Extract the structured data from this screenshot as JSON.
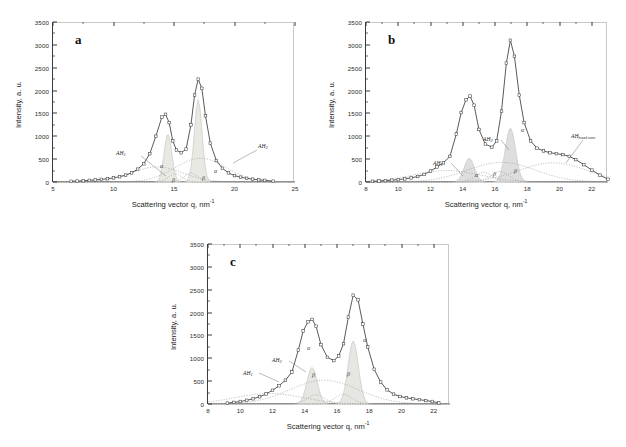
{
  "figure": {
    "axis_label_x": "Scattering vector q, nm",
    "axis_label_x_sup": "-1",
    "axis_label_y": "Intensity, a. u."
  },
  "chart_data": [
    {
      "type": "line",
      "panel": "a",
      "title": "a",
      "xlabel": "Scattering vector q, nm-1",
      "ylabel": "Intensity, a. u.",
      "xlim": [
        5,
        25
      ],
      "ylim": [
        0,
        3500
      ],
      "xticks": [
        5,
        10,
        15,
        20,
        25
      ],
      "yticks": [
        0,
        500,
        1000,
        1500,
        2000,
        2500,
        3000,
        3500
      ],
      "grid": false,
      "legend": "none",
      "series": [
        {
          "name": "experimental",
          "marker": "open-square",
          "x": [
            6.5,
            7.0,
            7.5,
            8.0,
            8.5,
            9.0,
            9.5,
            10.0,
            10.5,
            11.0,
            11.5,
            12.0,
            12.5,
            13.0,
            13.5,
            14.0,
            14.3,
            14.6,
            14.9,
            15.2,
            15.6,
            16.0,
            16.4,
            16.7,
            17.0,
            17.3,
            17.6,
            18.0,
            18.5,
            19.0,
            19.5,
            20.0,
            20.5,
            21.0,
            21.5,
            22.0,
            22.5,
            23.2
          ],
          "y": [
            15,
            20,
            28,
            35,
            45,
            58,
            72,
            90,
            115,
            150,
            200,
            280,
            400,
            620,
            1000,
            1420,
            1480,
            1300,
            900,
            700,
            640,
            720,
            1250,
            1900,
            2250,
            2050,
            1450,
            850,
            470,
            300,
            200,
            140,
            105,
            80,
            62,
            48,
            36,
            18
          ]
        },
        {
          "name": "alpha-peak-1",
          "label": "a",
          "center": 14.5,
          "height": 1050,
          "fill": "#e9e9e4"
        },
        {
          "name": "alpha-peak-2",
          "label": "a",
          "center": 17.0,
          "height": 1800,
          "fill": "#e9e9e4"
        },
        {
          "name": "beta-peak-1",
          "label": "b",
          "center": 15.1,
          "height": 180
        },
        {
          "name": "beta-peak-2",
          "label": "b",
          "center": 16.4,
          "height": 200
        },
        {
          "name": "amorphous-halo-1",
          "label": "AH",
          "sub": "1",
          "center": 13.6,
          "height": 330
        },
        {
          "name": "amorphous-halo-2",
          "label": "AH",
          "sub": "2",
          "center": 17.2,
          "height": 520
        }
      ],
      "annotations": [
        {
          "text": "AH",
          "sub": "1",
          "x_px": 116,
          "y_px": 150
        },
        {
          "text": "AH",
          "sub": "2",
          "x_px": 258,
          "y_px": 143
        },
        {
          "text": "a",
          "x_px": 160,
          "y_px": 163
        },
        {
          "text": "b",
          "x_px": 172,
          "y_px": 177
        },
        {
          "text": "b",
          "x_px": 202,
          "y_px": 175
        },
        {
          "text": "a",
          "x_px": 214,
          "y_px": 168
        }
      ]
    },
    {
      "type": "line",
      "panel": "b",
      "title": "b",
      "xlabel": "Scattering vector q, nm-1",
      "ylabel": "Intensity, a. u.",
      "xlim": [
        8,
        23
      ],
      "ylim": [
        0,
        3500
      ],
      "xticks": [
        8,
        10,
        12,
        14,
        16,
        18,
        20,
        22
      ],
      "yticks": [
        0,
        500,
        1000,
        1500,
        2000,
        2500,
        3000,
        3500
      ],
      "grid": false,
      "legend": "none",
      "series": [
        {
          "name": "experimental",
          "marker": "open-square",
          "x": [
            8.4,
            8.8,
            9.2,
            9.6,
            10.0,
            10.4,
            10.8,
            11.2,
            11.6,
            12.0,
            12.4,
            12.8,
            13.2,
            13.6,
            13.9,
            14.2,
            14.45,
            14.7,
            15.0,
            15.4,
            15.8,
            16.1,
            16.4,
            16.7,
            16.95,
            17.2,
            17.5,
            17.8,
            18.2,
            18.6,
            19.0,
            19.4,
            19.8,
            20.2,
            20.6,
            21.0,
            21.5,
            22.0,
            22.5,
            23.0
          ],
          "y": [
            15,
            22,
            30,
            40,
            52,
            68,
            90,
            120,
            165,
            240,
            330,
            420,
            560,
            1050,
            1520,
            1800,
            1880,
            1680,
            1150,
            830,
            760,
            900,
            1550,
            2600,
            3100,
            2750,
            1900,
            1300,
            900,
            740,
            680,
            640,
            620,
            600,
            560,
            490,
            380,
            260,
            150,
            60
          ]
        },
        {
          "name": "alpha-peak-1",
          "label": "a",
          "center": 14.4,
          "height": 520,
          "fill": "#dedede"
        },
        {
          "name": "alpha-peak-2",
          "label": "a",
          "center": 16.95,
          "height": 1180,
          "fill": "#dedede"
        },
        {
          "name": "beta-peak-1",
          "label": "b",
          "center": 15.3,
          "height": 210
        },
        {
          "name": "beta-peak-2",
          "label": "b",
          "center": 16.3,
          "height": 230
        },
        {
          "name": "amorphous-halo-1",
          "label": "AH",
          "sub": "1",
          "center": 13.0,
          "height": 250
        },
        {
          "name": "amorphous-halo-2",
          "label": "AH",
          "sub": "2",
          "center": 16.4,
          "height": 430
        },
        {
          "name": "amorphous-halo-bound-water",
          "label": "AH",
          "sub": "bound water",
          "center": 19.6,
          "height": 420
        }
      ],
      "annotations": [
        {
          "text": "AH",
          "sub": "1",
          "x_px": 433,
          "y_px": 160
        },
        {
          "text": "AH",
          "sub": "2",
          "x_px": 483,
          "y_px": 136
        },
        {
          "text": "AH",
          "sub": "bound water",
          "x_px": 571,
          "y_px": 133
        },
        {
          "text": "a",
          "x_px": 475,
          "y_px": 172
        },
        {
          "text": "b",
          "x_px": 493,
          "y_px": 171
        },
        {
          "text": "b",
          "x_px": 514,
          "y_px": 168
        },
        {
          "text": "a",
          "x_px": 521,
          "y_px": 127
        }
      ]
    },
    {
      "type": "line",
      "panel": "c",
      "title": "c",
      "xlabel": "Scattering vector q, nm-1",
      "ylabel": "Intensity, a. u.",
      "xlim": [
        8,
        23
      ],
      "ylim": [
        0,
        3500
      ],
      "xticks": [
        8,
        10,
        12,
        14,
        16,
        18,
        20,
        22
      ],
      "yticks": [
        0,
        500,
        1000,
        1500,
        2000,
        2500,
        3000,
        3500
      ],
      "grid": false,
      "legend": "none",
      "series": [
        {
          "name": "experimental",
          "marker": "open-square",
          "x": [
            9.2,
            9.6,
            10.0,
            10.4,
            10.8,
            11.2,
            11.6,
            12.0,
            12.4,
            12.8,
            13.2,
            13.6,
            13.9,
            14.2,
            14.45,
            14.7,
            15.0,
            15.4,
            15.8,
            16.1,
            16.4,
            16.7,
            17.0,
            17.3,
            17.6,
            17.9,
            18.3,
            18.7,
            19.1,
            19.5,
            19.9,
            20.3,
            20.7,
            21.1,
            21.5,
            21.9,
            22.3
          ],
          "y": [
            20,
            35,
            55,
            80,
            115,
            160,
            220,
            300,
            400,
            520,
            700,
            1180,
            1600,
            1800,
            1850,
            1700,
            1300,
            1020,
            950,
            1050,
            1320,
            1900,
            2380,
            2280,
            1750,
            1250,
            760,
            480,
            310,
            215,
            165,
            135,
            115,
            95,
            75,
            55,
            25
          ]
        },
        {
          "name": "alpha-peak-1",
          "label": "a",
          "center": 14.45,
          "height": 800,
          "fill": "#e6e6e2"
        },
        {
          "name": "alpha-peak-2",
          "label": "a",
          "center": 17.0,
          "height": 1380,
          "fill": "#e6e6e2"
        },
        {
          "name": "beta-peak-1",
          "label": "b",
          "center": 14.7,
          "height": 200
        },
        {
          "name": "beta-peak-2",
          "label": "b",
          "center": 16.4,
          "height": 210
        },
        {
          "name": "amorphous-halo-1",
          "label": "AH",
          "sub": "1",
          "center": 11.8,
          "height": 230
        },
        {
          "name": "amorphous-halo-2",
          "label": "AH",
          "sub": "2",
          "center": 15.2,
          "height": 520
        }
      ],
      "annotations": [
        {
          "text": "AH",
          "sub": "1",
          "x_px": 243,
          "y_px": 370
        },
        {
          "text": "AH",
          "sub": "2",
          "x_px": 272,
          "y_px": 357
        },
        {
          "text": "a",
          "x_px": 307,
          "y_px": 345
        },
        {
          "text": "b",
          "x_px": 312,
          "y_px": 372
        },
        {
          "text": "b",
          "x_px": 347,
          "y_px": 371
        },
        {
          "text": "a",
          "x_px": 363,
          "y_px": 337
        }
      ]
    }
  ]
}
